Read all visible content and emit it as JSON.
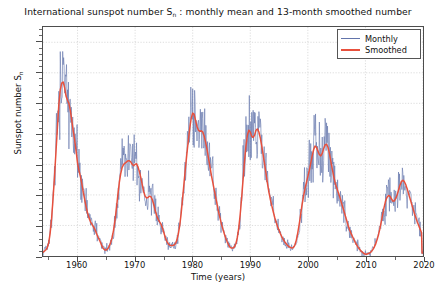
{
  "chart_data": {
    "type": "line",
    "title_main": "International sunspot number S",
    "title_sub": "n",
    "title_rest": " : monthly mean and 13-month smoothed number",
    "xlabel": "Time (years)",
    "ylabel_main": "Sunspot number S",
    "ylabel_sub": "n",
    "ylabel": "Sunspot number Sₙ",
    "xlim": [
      1954.0,
      2020.0
    ],
    "ylim": [
      0,
      375
    ],
    "grid": true,
    "legend_position": "upper right",
    "yticks": [
      0,
      50,
      100,
      150,
      200,
      250,
      300,
      350
    ],
    "xticks": [
      1960,
      1970,
      1980,
      1990,
      2000,
      2010,
      2020
    ],
    "ytick_labels": [
      "0",
      "50",
      "100",
      "150",
      "200",
      "250",
      "300",
      "350"
    ],
    "xtick_labels": [
      "1960",
      "1970",
      "1980",
      "1990",
      "2000",
      "2010",
      "2020"
    ],
    "colors": {
      "monthly": "#6274ab",
      "smoothed": "#e8503c",
      "axis": "#4d4d4d",
      "grid": "#cccccc",
      "background": "#ffffff"
    },
    "series": [
      {
        "name": "Monthly",
        "color": "#6274ab",
        "linewidth": 0.7
      },
      {
        "name": "Smoothed",
        "color": "#e8503c",
        "linewidth": 1.6
      }
    ],
    "x": [
      1954.0,
      1954.25,
      1954.5,
      1954.75,
      1955.0,
      1955.25,
      1955.5,
      1955.75,
      1956.0,
      1956.25,
      1956.5,
      1956.75,
      1957.0,
      1957.25,
      1957.5,
      1957.75,
      1958.0,
      1958.25,
      1958.5,
      1958.75,
      1959.0,
      1959.25,
      1959.5,
      1959.75,
      1960.0,
      1960.25,
      1960.5,
      1960.75,
      1961.0,
      1961.25,
      1961.5,
      1961.75,
      1962.0,
      1962.25,
      1962.5,
      1962.75,
      1963.0,
      1963.25,
      1963.5,
      1963.75,
      1964.0,
      1964.25,
      1964.5,
      1964.75,
      1965.0,
      1965.25,
      1965.5,
      1965.75,
      1966.0,
      1966.25,
      1966.5,
      1966.75,
      1967.0,
      1967.25,
      1967.5,
      1967.75,
      1968.0,
      1968.25,
      1968.5,
      1968.75,
      1969.0,
      1969.25,
      1969.5,
      1969.75,
      1970.0,
      1970.25,
      1970.5,
      1970.75,
      1971.0,
      1971.25,
      1971.5,
      1971.75,
      1972.0,
      1972.25,
      1972.5,
      1972.75,
      1973.0,
      1973.25,
      1973.5,
      1973.75,
      1974.0,
      1974.25,
      1974.5,
      1974.75,
      1975.0,
      1975.25,
      1975.5,
      1975.75,
      1976.0,
      1976.25,
      1976.5,
      1976.75,
      1977.0,
      1977.25,
      1977.5,
      1977.75,
      1978.0,
      1978.25,
      1978.5,
      1978.75,
      1979.0,
      1979.25,
      1979.5,
      1979.75,
      1980.0,
      1980.25,
      1980.5,
      1980.75,
      1981.0,
      1981.25,
      1981.5,
      1981.75,
      1982.0,
      1982.25,
      1982.5,
      1982.75,
      1983.0,
      1983.25,
      1983.5,
      1983.75,
      1984.0,
      1984.25,
      1984.5,
      1984.75,
      1985.0,
      1985.25,
      1985.5,
      1985.75,
      1986.0,
      1986.25,
      1986.5,
      1986.75,
      1987.0,
      1987.25,
      1987.5,
      1987.75,
      1988.0,
      1988.25,
      1988.5,
      1988.75,
      1989.0,
      1989.25,
      1989.5,
      1989.75,
      1990.0,
      1990.25,
      1990.5,
      1990.75,
      1991.0,
      1991.25,
      1991.5,
      1991.75,
      1992.0,
      1992.25,
      1992.5,
      1992.75,
      1993.0,
      1993.25,
      1993.5,
      1993.75,
      1994.0,
      1994.25,
      1994.5,
      1994.75,
      1995.0,
      1995.25,
      1995.5,
      1995.75,
      1996.0,
      1996.25,
      1996.5,
      1996.75,
      1997.0,
      1997.25,
      1997.5,
      1997.75,
      1998.0,
      1998.25,
      1998.5,
      1998.75,
      1999.0,
      1999.25,
      1999.5,
      1999.75,
      2000.0,
      2000.25,
      2000.5,
      2000.75,
      2001.0,
      2001.25,
      2001.5,
      2001.75,
      2002.0,
      2002.25,
      2002.5,
      2002.75,
      2003.0,
      2003.25,
      2003.5,
      2003.75,
      2004.0,
      2004.25,
      2004.5,
      2004.75,
      2005.0,
      2005.25,
      2005.5,
      2005.75,
      2006.0,
      2006.25,
      2006.5,
      2006.75,
      2007.0,
      2007.25,
      2007.5,
      2007.75,
      2008.0,
      2008.25,
      2008.5,
      2008.75,
      2009.0,
      2009.25,
      2009.5,
      2009.75,
      2010.0,
      2010.25,
      2010.5,
      2010.75,
      2011.0,
      2011.25,
      2011.5,
      2011.75,
      2012.0,
      2012.25,
      2012.5,
      2012.75,
      2013.0,
      2013.25,
      2013.5,
      2013.75,
      2014.0,
      2014.25,
      2014.5,
      2014.75,
      2015.0,
      2015.25,
      2015.5,
      2015.75,
      2016.0,
      2016.25,
      2016.5,
      2016.75,
      2017.0,
      2017.25,
      2017.5,
      2017.75,
      2018.0,
      2018.25,
      2018.5,
      2018.75,
      2019.0,
      2019.25,
      2019.5,
      2019.75
    ],
    "smoothed": [
      6,
      8,
      10,
      14,
      22,
      38,
      62,
      95,
      130,
      170,
      210,
      248,
      272,
      283,
      285,
      276,
      262,
      255,
      250,
      238,
      222,
      205,
      190,
      172,
      152,
      140,
      130,
      118,
      104,
      92,
      80,
      70,
      62,
      56,
      52,
      48,
      44,
      38,
      32,
      27,
      22,
      16,
      12,
      10,
      10,
      12,
      16,
      22,
      30,
      42,
      58,
      78,
      100,
      120,
      135,
      145,
      150,
      152,
      154,
      156,
      156,
      154,
      150,
      148,
      150,
      151,
      146,
      138,
      128,
      116,
      105,
      98,
      95,
      96,
      98,
      97,
      92,
      84,
      74,
      66,
      60,
      56,
      52,
      46,
      38,
      30,
      24,
      20,
      18,
      17,
      17,
      18,
      20,
      26,
      36,
      50,
      70,
      95,
      120,
      145,
      168,
      190,
      210,
      226,
      234,
      232,
      222,
      212,
      206,
      204,
      205,
      203,
      196,
      186,
      174,
      160,
      146,
      132,
      120,
      108,
      96,
      84,
      72,
      62,
      52,
      44,
      36,
      29,
      23,
      18,
      14,
      13,
      13,
      15,
      20,
      30,
      46,
      68,
      95,
      125,
      155,
      180,
      198,
      206,
      203,
      196,
      194,
      198,
      206,
      208,
      203,
      193,
      180,
      165,
      150,
      134,
      118,
      104,
      92,
      82,
      72,
      63,
      55,
      48,
      42,
      36,
      31,
      27,
      23,
      20,
      17,
      15,
      14,
      13,
      14,
      18,
      26,
      38,
      52,
      68,
      84,
      98,
      110,
      120,
      130,
      140,
      152,
      164,
      174,
      180,
      178,
      172,
      166,
      164,
      168,
      176,
      182,
      183,
      178,
      168,
      155,
      142,
      130,
      120,
      112,
      105,
      98,
      90,
      82,
      74,
      66,
      58,
      50,
      43,
      37,
      32,
      27,
      22,
      18,
      14,
      11,
      8,
      6,
      4,
      3,
      3,
      4,
      5,
      7,
      10,
      14,
      19,
      26,
      34,
      44,
      56,
      68,
      80,
      90,
      96,
      99,
      98,
      94,
      90,
      90,
      94,
      100,
      108,
      116,
      122,
      124,
      122,
      117,
      110,
      102,
      94,
      86,
      78,
      70,
      63,
      56,
      50,
      44,
      38,
      33,
      28,
      24,
      20,
      17,
      14,
      12,
      10,
      8,
      7,
      6,
      5,
      5,
      4,
      4,
      4,
      5
    ],
    "annotations": [
      {
        "cycle": 19,
        "peak_year": 1957.5,
        "smoothed_peak": 285,
        "monthly_peak": 359
      },
      {
        "cycle": 20,
        "peak_year": 1968.9,
        "smoothed_peak": 157,
        "monthly_peak": 196
      },
      {
        "cycle": 21,
        "peak_year": 1979.8,
        "smoothed_peak": 234,
        "monthly_peak": 269
      },
      {
        "cycle": 22,
        "peak_year": 1989.6,
        "smoothed_peak": 208,
        "monthly_peak": 288
      },
      {
        "cycle": 23,
        "peak_year": 2000.3,
        "smoothed_peak": 183,
        "monthly_peak": 244
      },
      {
        "cycle": 24,
        "peak_year": 2014.2,
        "smoothed_peak": 124,
        "monthly_peak": 147
      }
    ]
  },
  "legend": {
    "items": [
      {
        "label": "Monthly",
        "color": "#6274ab"
      },
      {
        "label": "Smoothed",
        "color": "#e8503c"
      }
    ]
  }
}
